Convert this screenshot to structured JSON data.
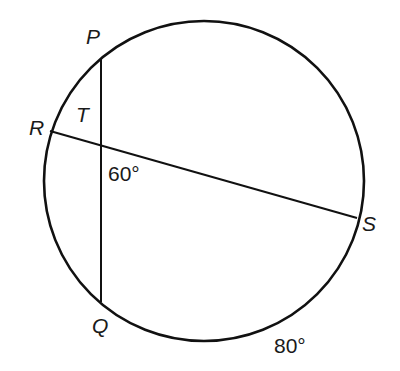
{
  "diagram": {
    "type": "circle-with-intersecting-chords",
    "points": {
      "P": "P",
      "Q": "Q",
      "R": "R",
      "S": "S",
      "T": "T"
    },
    "angle_label": "60°",
    "arc_label": "80°",
    "chords": [
      "PQ",
      "RS"
    ],
    "colors": {
      "stroke": "#111111",
      "background": "#ffffff"
    }
  }
}
